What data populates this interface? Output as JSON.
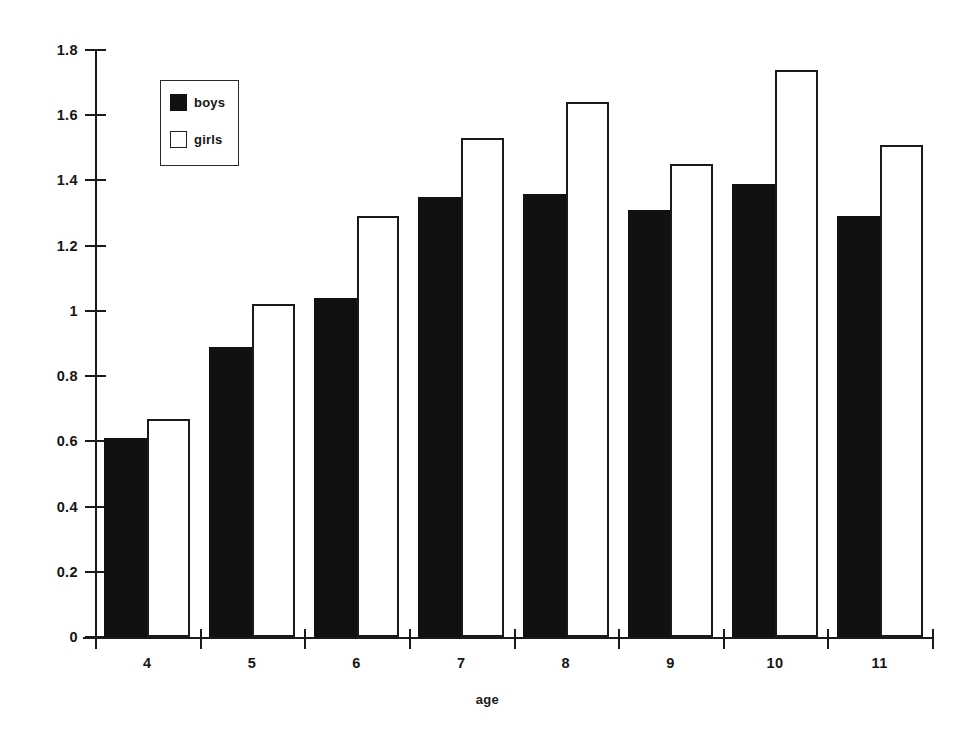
{
  "chart_data": {
    "type": "bar",
    "title": "",
    "subtitle": "",
    "xlabel": "age",
    "ylabel": "",
    "categories": [
      "4",
      "5",
      "6",
      "7",
      "8",
      "9",
      "10",
      "11"
    ],
    "series": [
      {
        "name": "boys",
        "color": "#111111",
        "fill": "solid",
        "values": [
          0.61,
          0.89,
          1.04,
          1.35,
          1.36,
          1.31,
          1.39,
          1.29
        ]
      },
      {
        "name": "girls",
        "color": "#ffffff",
        "fill": "hollow",
        "values": [
          0.67,
          1.02,
          1.29,
          1.53,
          1.64,
          1.45,
          1.74,
          1.51
        ]
      }
    ],
    "ylim": [
      0,
      1.8
    ],
    "ytick_labels": [
      "0",
      "0.2",
      "0.4",
      "0.6",
      "0.8",
      "1",
      "1.2",
      "1.4",
      "1.6",
      "1.8"
    ],
    "ytick_values": [
      0,
      0.2,
      0.4,
      0.6,
      0.8,
      1.0,
      1.2,
      1.4,
      1.6,
      1.8
    ],
    "xtick_labels": [
      "4",
      "5",
      "6",
      "7",
      "8",
      "9",
      "10",
      "11"
    ],
    "grid": false,
    "legend_position": "upper-left",
    "legend_entries": [
      "boys",
      "girls"
    ],
    "annotations": []
  },
  "axis": {
    "x_title": "age"
  }
}
